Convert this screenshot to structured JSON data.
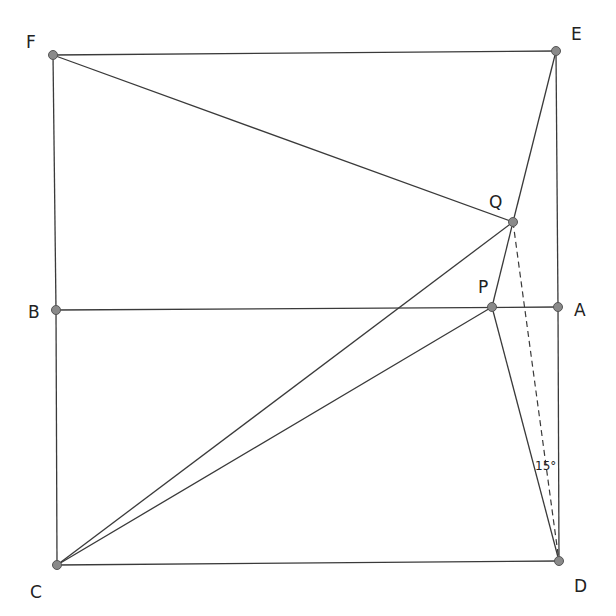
{
  "diagram": {
    "type": "geometry",
    "points": [
      {
        "id": "F",
        "x": 53,
        "y": 55,
        "label_x": 26,
        "label_y": 48
      },
      {
        "id": "E",
        "x": 556,
        "y": 51,
        "label_x": 571,
        "label_y": 40
      },
      {
        "id": "Q",
        "x": 513,
        "y": 222,
        "label_x": 489,
        "label_y": 208
      },
      {
        "id": "P",
        "x": 492,
        "y": 307,
        "label_x": 478,
        "label_y": 293
      },
      {
        "id": "A",
        "x": 558,
        "y": 307,
        "label_x": 574,
        "label_y": 316
      },
      {
        "id": "B",
        "x": 56,
        "y": 310,
        "label_x": 28,
        "label_y": 318
      },
      {
        "id": "C",
        "x": 57,
        "y": 565,
        "label_x": 30,
        "label_y": 598
      },
      {
        "id": "D",
        "x": 559,
        "y": 561,
        "label_x": 574,
        "label_y": 592
      }
    ],
    "segments": [
      {
        "from": "F",
        "to": "E",
        "style": "solid"
      },
      {
        "from": "F",
        "to": "B",
        "style": "solid"
      },
      {
        "from": "B",
        "to": "C",
        "style": "solid"
      },
      {
        "from": "C",
        "to": "D",
        "style": "solid"
      },
      {
        "from": "E",
        "to": "A",
        "style": "solid"
      },
      {
        "from": "A",
        "to": "D",
        "style": "solid"
      },
      {
        "from": "B",
        "to": "A",
        "style": "solid"
      },
      {
        "from": "F",
        "to": "Q",
        "style": "solid"
      },
      {
        "from": "E",
        "to": "Q",
        "style": "solid"
      },
      {
        "from": "Q",
        "to": "P",
        "style": "solid"
      },
      {
        "from": "C",
        "to": "Q",
        "style": "solid"
      },
      {
        "from": "C",
        "to": "P",
        "style": "solid"
      },
      {
        "from": "P",
        "to": "D",
        "style": "solid"
      },
      {
        "from": "Q",
        "to": "D",
        "style": "dashed"
      }
    ],
    "annotations": [
      {
        "text": "15°",
        "x": 535,
        "y": 470,
        "meaning": "angle PDA"
      }
    ]
  }
}
